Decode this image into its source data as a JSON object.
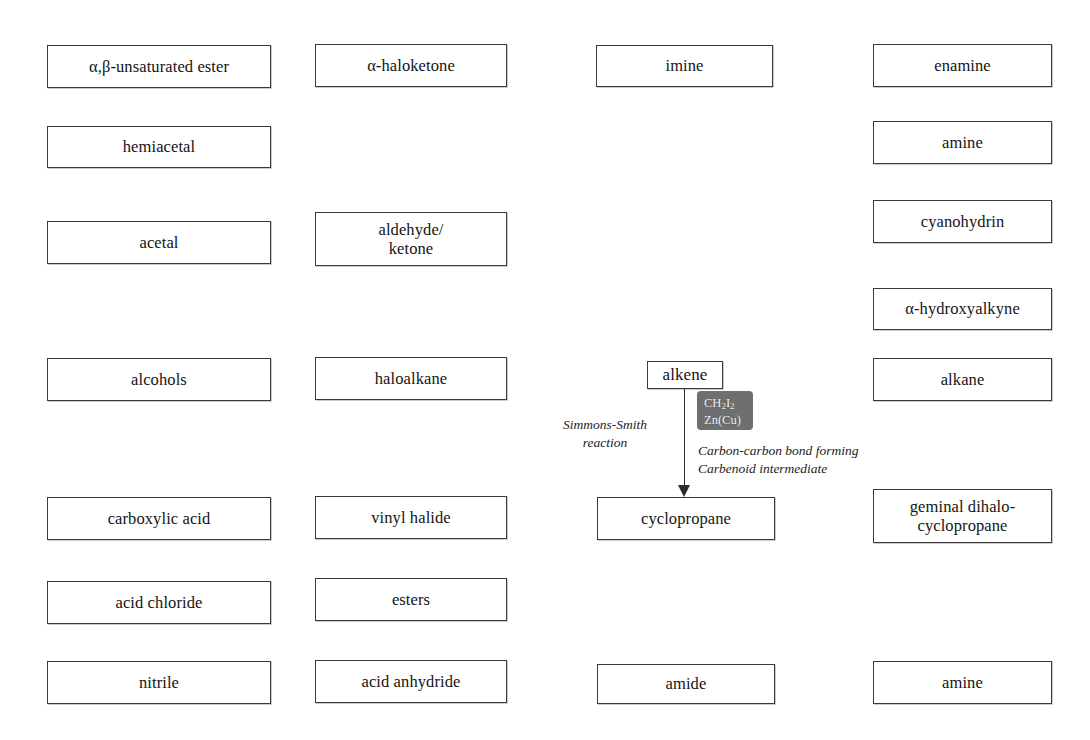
{
  "diagram": {
    "background_color": "#ffffff",
    "box_border_color": "#3a3a3a",
    "reagent_chip_color": "#6f6f6f",
    "reagent_text_color": "#f2f2f2",
    "arrow_color": "#2b2b2b"
  },
  "boxes": {
    "unsaturated_ester": "α,β-unsaturated ester",
    "haloketone": "α-haloketone",
    "imine": "imine",
    "enamine": "enamine",
    "hemiacetal": "hemiacetal",
    "amine_top": "amine",
    "acetal": "acetal",
    "aldehyde_ketone": "aldehyde/\nketone",
    "cyanohydrin": "cyanohydrin",
    "hydroxyalkyne": "α-hydroxyalkyne",
    "alcohols": "alcohols",
    "haloalkane": "haloalkane",
    "alkene": "alkene",
    "alkane": "alkane",
    "carboxylic_acid": "carboxylic acid",
    "vinyl_halide": "vinyl halide",
    "cyclopropane": "cyclopropane",
    "geminal_dihalocyclopropane": "geminal dihalo-\ncyclopropane",
    "acid_chloride": "acid chloride",
    "esters": "esters",
    "nitrile": "nitrile",
    "acid_anhydride": "acid anhydride",
    "amide": "amide",
    "amine_bottom": "amine"
  },
  "reaction": {
    "source": "alkene",
    "product": "cyclopropane",
    "name_annotation": "Simmons-Smith\nreaction",
    "note_annotation": "Carbon-carbon bond forming\nCarbenoid intermediate",
    "reagent_line_1_prefix": "CH",
    "reagent_line_1_sub_1": "2",
    "reagent_line_1_mid": "I",
    "reagent_line_1_sub_2": "2",
    "reagent_line_2": "Zn(Cu)"
  }
}
